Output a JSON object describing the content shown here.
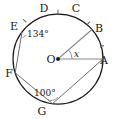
{
  "figure": {
    "type": "circle-geometry-diagram",
    "center_label": "O",
    "points": [
      {
        "name": "A",
        "label": "A",
        "angle_deg": 0,
        "label_x": 104,
        "label_y": 64
      },
      {
        "name": "B",
        "label": "B",
        "angle_deg": 41,
        "label_x": 99,
        "label_y": 32
      },
      {
        "name": "C",
        "label": "C",
        "angle_deg": 74,
        "label_x": 76,
        "label_y": 12
      },
      {
        "name": "D",
        "label": "D",
        "angle_deg": 106,
        "label_x": 44,
        "label_y": 12
      },
      {
        "name": "E",
        "label": "E",
        "angle_deg": 143,
        "label_x": 14,
        "label_y": 30
      },
      {
        "name": "F",
        "label": "F",
        "angle_deg": 198,
        "label_x": 9,
        "label_y": 77
      },
      {
        "name": "G",
        "label": "G",
        "angle_deg": 263,
        "label_x": 42,
        "label_y": 115
      }
    ],
    "angles": [
      {
        "name": "angle-at-E",
        "value": "134°",
        "vertex": "E",
        "x": 27,
        "y": 37
      },
      {
        "name": "angle-at-G",
        "value": "100°",
        "vertex": "G",
        "x": 34,
        "y": 96
      },
      {
        "name": "angle-at-O",
        "value": "x",
        "vertex": "O",
        "x": 74,
        "y": 57
      }
    ],
    "segments": [
      {
        "name": "radius-OA",
        "from": "O",
        "to": "A"
      },
      {
        "name": "radius-OB",
        "from": "O",
        "to": "B"
      },
      {
        "name": "chord-EF",
        "from": "E",
        "to": "F"
      },
      {
        "name": "chord-FG",
        "from": "F",
        "to": "G"
      },
      {
        "name": "chord-GA",
        "from": "G",
        "to": "A"
      }
    ],
    "equal_arc_ticks": [
      "arc-ED",
      "arc-DC",
      "arc-CB",
      "arc-BA"
    ],
    "colors": {
      "circle_stroke": "#1c1c1c",
      "chord_stroke": "#6e6e6e",
      "label_color": "#1a1a1a",
      "background": "#ffffff"
    }
  }
}
